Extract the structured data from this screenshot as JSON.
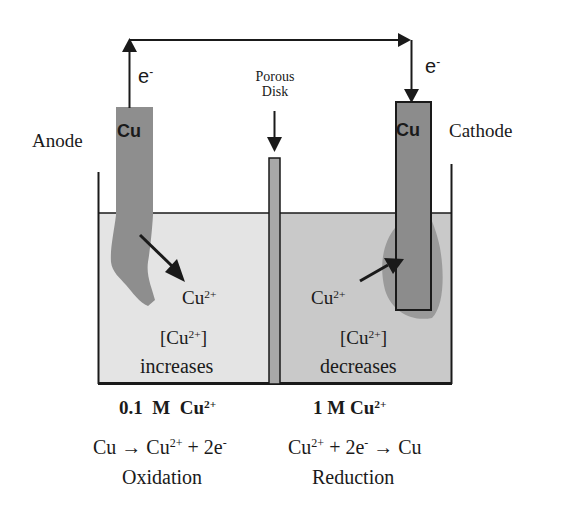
{
  "diagram": {
    "type": "electrochemical-concentration-cell",
    "wire": {
      "electron_label": "e",
      "electron_charge": "-"
    },
    "left_half": {
      "electrode_symbol": "Cu",
      "electrode_role": "Anode",
      "ion": "Cu",
      "ion_charge": "2+",
      "bracket_ion": "[Cu",
      "bracket_charge": "2+",
      "bracket_close": "]",
      "concentration_change": "increases",
      "concentration_number": "0.1",
      "concentration_unit": "M",
      "concentration_ion": "Cu",
      "concentration_charge": "2+",
      "equation_lhs": "Cu →",
      "equation_ion": "Cu",
      "equation_ion_charge": "2+",
      "equation_rhs": "+ 2e",
      "equation_rhs_charge": "-",
      "process": "Oxidation",
      "solution_color": "#e4e4e4",
      "electrode_color": "#8c8c8c"
    },
    "right_half": {
      "electrode_symbol": "Cu",
      "electrode_role": "Cathode",
      "ion": "Cu",
      "ion_charge": "2+",
      "bracket_ion": "[Cu",
      "bracket_charge": "2+",
      "bracket_close": "]",
      "concentration_change": "decreases",
      "concentration_number": "1",
      "concentration_unit": "M",
      "concentration_ion": "Cu",
      "concentration_charge": "2+",
      "equation_ion": "Cu",
      "equation_ion_charge": "2+",
      "equation_mid": "+ 2e",
      "equation_mid_charge": "-",
      "equation_rhs": "→ Cu",
      "process": "Reduction",
      "solution_color": "#c8c8c8",
      "electrode_color": "#8c8c8c"
    },
    "separator": {
      "label_line1": "Porous",
      "label_line2": "Disk",
      "color": "#a8a8a8"
    }
  }
}
